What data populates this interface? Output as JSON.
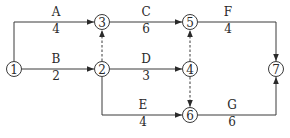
{
  "diagram": {
    "type": "activity-on-arrow network",
    "nodes": [
      {
        "id": "1",
        "label": "1",
        "x": 14,
        "y": 69
      },
      {
        "id": "2",
        "label": "2",
        "x": 102,
        "y": 69
      },
      {
        "id": "3",
        "label": "3",
        "x": 102,
        "y": 22
      },
      {
        "id": "4",
        "label": "4",
        "x": 190,
        "y": 69
      },
      {
        "id": "5",
        "label": "5",
        "x": 190,
        "y": 22
      },
      {
        "id": "6",
        "label": "6",
        "x": 190,
        "y": 115
      },
      {
        "id": "7",
        "label": "7",
        "x": 276,
        "y": 69
      }
    ],
    "activities": [
      {
        "name": "A",
        "duration": "4",
        "from": "1",
        "to": "3"
      },
      {
        "name": "B",
        "duration": "2",
        "from": "1",
        "to": "2"
      },
      {
        "name": "C",
        "duration": "6",
        "from": "3",
        "to": "5"
      },
      {
        "name": "D",
        "duration": "3",
        "from": "2",
        "to": "4"
      },
      {
        "name": "E",
        "duration": "4",
        "from": "2",
        "to": "6"
      },
      {
        "name": "F",
        "duration": "4",
        "from": "5",
        "to": "7"
      },
      {
        "name": "G",
        "duration": "6",
        "from": "6",
        "to": "7"
      }
    ],
    "dummy_activities": [
      {
        "from": "2",
        "to": "3"
      },
      {
        "from": "4",
        "to": "5"
      },
      {
        "from": "4",
        "to": "6"
      }
    ],
    "colors": {
      "line": "#3a3a3a",
      "text": "#2a2a2a",
      "background": "#ffffff"
    }
  }
}
